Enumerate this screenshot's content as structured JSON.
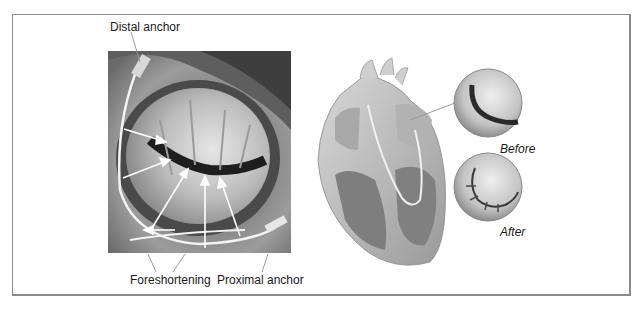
{
  "figure": {
    "left_panel": {
      "subject": "mitral annulus photograph with coronary sinus device",
      "labels": {
        "distal_anchor": "Distal anchor",
        "foreshortening": "Foreshortening",
        "proximal_anchor": "Proximal anchor"
      }
    },
    "right_panel": {
      "subject": "heart cross-section illustration",
      "insets": [
        {
          "id": "before",
          "label": "Before"
        },
        {
          "id": "after",
          "label": "After"
        }
      ]
    }
  }
}
